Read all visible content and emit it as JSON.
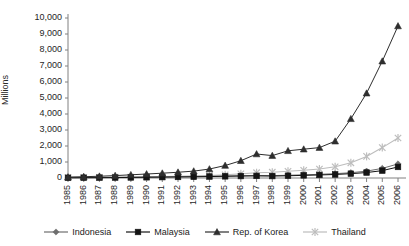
{
  "chart_data": {
    "type": "line",
    "title": "",
    "subtitle": "",
    "xlabel": "",
    "ylabel": "Millions",
    "ylim": [
      0,
      10000
    ],
    "ytick_labels": [
      "10,000",
      "9,000",
      "8,000",
      "7,000",
      "6,000",
      "5,000",
      "4,000",
      "3,000",
      "2,000",
      "1,000",
      "0"
    ],
    "ytick_values": [
      10000,
      9000,
      8000,
      7000,
      6000,
      5000,
      4000,
      3000,
      2000,
      1000,
      0
    ],
    "grid": false,
    "legend_position": "bottom",
    "categories": [
      "1985",
      "1986",
      "1987",
      "1988",
      "1989",
      "1990",
      "1991",
      "1992",
      "1993",
      "1994",
      "1995",
      "1996",
      "1997",
      "1998",
      "1999",
      "2000",
      "2001",
      "2002",
      "2003",
      "2004",
      "2005",
      "2006"
    ],
    "x": [
      1985,
      1986,
      1987,
      1988,
      1989,
      1990,
      1991,
      1992,
      1993,
      1994,
      1995,
      1996,
      1997,
      1998,
      1999,
      2000,
      2001,
      2002,
      2003,
      2004,
      2005,
      2006
    ],
    "series": [
      {
        "name": "Indonesia",
        "marker": "diamond",
        "color": "#6e6e6e",
        "values": [
          20,
          25,
          30,
          40,
          50,
          60,
          70,
          80,
          90,
          110,
          130,
          150,
          160,
          150,
          170,
          200,
          230,
          270,
          330,
          430,
          600,
          880
        ]
      },
      {
        "name": "Malaysia",
        "marker": "square",
        "color": "#141414",
        "values": [
          15,
          18,
          22,
          28,
          35,
          45,
          55,
          65,
          75,
          90,
          105,
          120,
          130,
          120,
          140,
          165,
          190,
          220,
          270,
          340,
          460,
          690
        ]
      },
      {
        "name": "Rep. of Korea",
        "marker": "triangle",
        "color": "#2e2e2e",
        "values": [
          60,
          80,
          110,
          150,
          200,
          250,
          300,
          360,
          430,
          560,
          780,
          1080,
          1500,
          1400,
          1700,
          1800,
          1900,
          2300,
          3700,
          5300,
          7300,
          9500
        ]
      },
      {
        "name": "Thailand",
        "marker": "star",
        "color": "#bdbdbd",
        "values": [
          25,
          30,
          38,
          48,
          60,
          75,
          90,
          110,
          130,
          160,
          200,
          260,
          330,
          360,
          420,
          480,
          560,
          700,
          950,
          1350,
          1900,
          2500
        ]
      }
    ]
  },
  "legend": {
    "items": [
      {
        "label": "Indonesia",
        "marker": "diamond",
        "color": "#6e6e6e"
      },
      {
        "label": "Malaysia",
        "marker": "square",
        "color": "#141414"
      },
      {
        "label": "Rep. of Korea",
        "marker": "triangle",
        "color": "#2e2e2e"
      },
      {
        "label": "Thailand",
        "marker": "star",
        "color": "#bdbdbd"
      }
    ]
  },
  "axes": {
    "y_title": "Millions"
  }
}
